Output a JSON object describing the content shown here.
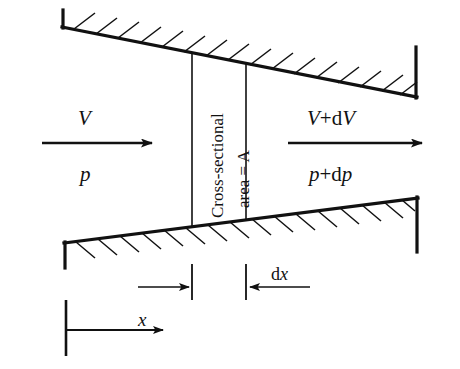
{
  "figure": {
    "type": "technical-line-diagram",
    "background_color": "#ffffff",
    "line_color": "#111111"
  },
  "labels": {
    "inlet_velocity": "V",
    "inlet_pressure": "p",
    "outlet_velocity_var": "V",
    "outlet_velocity_op": "+",
    "outlet_velocity_d": "d",
    "outlet_velocity_dvar": "V",
    "outlet_pressure_var": "p",
    "outlet_pressure_op": "+",
    "outlet_pressure_d": "d",
    "outlet_pressure_dvar": "p",
    "control_volume_line1": "Cross-sectional",
    "control_volume_line2": "area = A",
    "dx_d": "d",
    "dx_var": "x",
    "x_distance": "x"
  },
  "geometry": {
    "upper_wall": {
      "left_x": 62,
      "left_y": 27,
      "right_x": 417,
      "right_y": 97,
      "endcap_left_top_y": 10,
      "endcap_right_top_y": 47,
      "hatch_count": 16,
      "hatch_direction": "up-right"
    },
    "lower_wall": {
      "left_x": 64,
      "left_y": 243,
      "right_x": 418,
      "right_y": 198,
      "endcap_left_bottom_y": 268,
      "endcap_right_bottom_y": 252,
      "hatch_count": 16,
      "hatch_direction": "down-right"
    },
    "control_volume": {
      "left_face_x": 192,
      "right_face_x": 246,
      "top_left_y": 53,
      "top_right_y": 64,
      "bottom_left_y": 226,
      "bottom_right_y": 219
    },
    "arrows": {
      "inlet_arrow": {
        "x1": 42,
        "y1": 143,
        "x2": 158,
        "y2": 143,
        "direction": "right"
      },
      "outlet_arrow": {
        "x1": 288,
        "y1": 143,
        "x2": 428,
        "y2": 143,
        "direction": "right"
      },
      "dx_arrow_left": {
        "x1": 138,
        "y1": 287,
        "x2": 192,
        "y2": 287,
        "direction": "right"
      },
      "dx_arrow_right": {
        "x1": 305,
        "y1": 287,
        "x2": 248,
        "y2": 287,
        "direction": "left"
      },
      "x_arrow": {
        "x1": 66,
        "y1": 330,
        "x2": 168,
        "y2": 330,
        "direction": "right"
      }
    },
    "dimension_ticks": {
      "dx_left_tick_x": 192,
      "dx_right_tick_x": 246,
      "x_origin_tick_x": 66
    }
  }
}
